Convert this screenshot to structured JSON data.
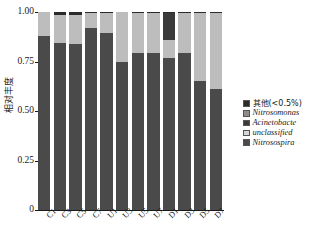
{
  "chart_data": {
    "type": "bar",
    "subtype": "stacked-bar-100pct",
    "title": "",
    "xlabel": "",
    "ylabel": "相对丰度",
    "ylim": [
      0,
      1.0
    ],
    "yticks": [
      0,
      0.25,
      0.5,
      0.75,
      1.0
    ],
    "ytick_labels": [
      "0",
      "0.25",
      "0.50",
      "0.75",
      "1.00"
    ],
    "grid": false,
    "legend_position": "right",
    "categories": [
      "C1",
      "C3",
      "C5",
      "C7",
      "U1",
      "U3",
      "U5",
      "U7",
      "D1",
      "D3",
      "D5",
      "D7"
    ],
    "series": [
      {
        "name": "Nitrosospira",
        "color": "#4a4a4a",
        "values": [
          0.88,
          0.845,
          0.84,
          0.92,
          0.895,
          0.75,
          0.795,
          0.795,
          0.77,
          0.795,
          0.65,
          0.61
        ]
      },
      {
        "name": "unclassified",
        "color": "#bdbdbd",
        "values": [
          0.12,
          0.14,
          0.145,
          0.075,
          0.1,
          0.248,
          0.2,
          0.2,
          0.09,
          0.2,
          0.345,
          0.385
        ]
      },
      {
        "name": "Acinetobacte",
        "color": "#3a3a3a",
        "values": [
          0.0,
          0.0,
          0.0,
          0.0,
          0.0,
          0.0,
          0.0,
          0.0,
          0.135,
          0.0,
          0.0,
          0.0
        ]
      },
      {
        "name": "Nitrosomonas",
        "color": "#8c8c8c",
        "values": [
          0.0,
          0.0,
          0.0,
          0.0,
          0.0,
          0.0,
          0.0,
          0.0,
          0.0,
          0.0,
          0.0,
          0.0
        ]
      },
      {
        "name": "其他(<0.5%)",
        "color": "#2b2b2b",
        "values": [
          0.0,
          0.015,
          0.015,
          0.005,
          0.005,
          0.002,
          0.005,
          0.005,
          0.005,
          0.005,
          0.005,
          0.005
        ]
      }
    ],
    "legend": [
      {
        "label": "其他(<0.5%)",
        "color": "#2b2b2b",
        "style": "cjk"
      },
      {
        "label": "Nitrosomonas",
        "color": "#8c8c8c",
        "style": "ital"
      },
      {
        "label": "Acinetobacte",
        "color": "#3a3a3a",
        "style": "ital"
      },
      {
        "label": "unclassified",
        "color": "#d6d6d6",
        "style": "ital"
      },
      {
        "label": "Nitrosospira",
        "color": "#4a4a4a",
        "style": "ital"
      }
    ]
  }
}
